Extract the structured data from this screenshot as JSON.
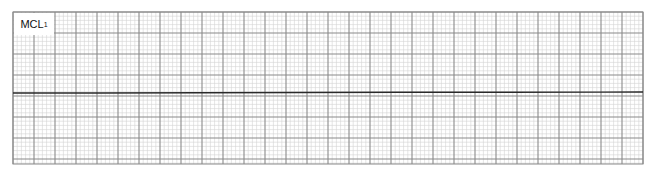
{
  "strip": {
    "lead_label": "MCL",
    "lead_subscript": "1"
  },
  "colors": {
    "background": "#ffffff",
    "minor_grid": "#d4d4d4",
    "major_grid": "#8a8a8a",
    "trace": "#2a2a2a"
  },
  "chart_data": {
    "type": "line",
    "title": "MCL1",
    "xlabel": "",
    "ylabel": "",
    "grid": true,
    "legend": "none",
    "grid_layout": {
      "left": 13,
      "top": 12,
      "right": 643,
      "bottom": 164,
      "minor_px": 4.2,
      "major_px": 21
    },
    "series": [
      {
        "name": "MCL1",
        "x": [
          13,
          100,
          200,
          300,
          400,
          500,
          600,
          643
        ],
        "y": [
          93,
          93,
          92.8,
          92.5,
          92.3,
          92.2,
          92.1,
          92
        ]
      }
    ]
  }
}
